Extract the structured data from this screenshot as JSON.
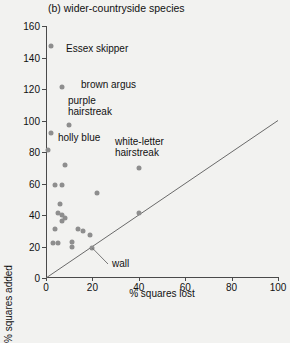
{
  "chart_data": {
    "type": "scatter",
    "title": "(b) wider-countryside species",
    "xlabel": "% squares lost",
    "ylabel": "% squares added",
    "xlim": [
      0,
      100
    ],
    "ylim": [
      0,
      160
    ],
    "xticks": [
      0,
      20,
      40,
      60,
      80,
      100
    ],
    "yticks": [
      0,
      20,
      40,
      60,
      80,
      100,
      120,
      140,
      160
    ],
    "grid": false,
    "legend": "none",
    "reference_line": {
      "name": "one-to-one line",
      "from": [
        0,
        0
      ],
      "to": [
        100,
        100
      ]
    },
    "points": [
      {
        "x": 2,
        "y": 147,
        "label": "Essex skipper"
      },
      {
        "x": 7,
        "y": 121,
        "label": "brown argus"
      },
      {
        "x": 10,
        "y": 97,
        "label": "purple hairstreak"
      },
      {
        "x": 2,
        "y": 92,
        "label": "holly blue"
      },
      {
        "x": 40,
        "y": 70,
        "label": "white-letter hairstreak"
      },
      {
        "x": 20,
        "y": 19,
        "label": "wall"
      },
      {
        "x": 1,
        "y": 81,
        "label": ""
      },
      {
        "x": 8,
        "y": 72,
        "label": ""
      },
      {
        "x": 4,
        "y": 59,
        "label": ""
      },
      {
        "x": 7,
        "y": 59,
        "label": ""
      },
      {
        "x": 22,
        "y": 54,
        "label": ""
      },
      {
        "x": 6,
        "y": 47,
        "label": ""
      },
      {
        "x": 5,
        "y": 41,
        "label": ""
      },
      {
        "x": 7,
        "y": 40,
        "label": ""
      },
      {
        "x": 8,
        "y": 38,
        "label": ""
      },
      {
        "x": 7,
        "y": 36,
        "label": ""
      },
      {
        "x": 40,
        "y": 41,
        "label": ""
      },
      {
        "x": 4,
        "y": 31,
        "label": ""
      },
      {
        "x": 14,
        "y": 31,
        "label": ""
      },
      {
        "x": 16,
        "y": 30,
        "label": ""
      },
      {
        "x": 19,
        "y": 27,
        "label": ""
      },
      {
        "x": 3,
        "y": 22,
        "label": ""
      },
      {
        "x": 5,
        "y": 22,
        "label": ""
      },
      {
        "x": 11,
        "y": 23,
        "label": ""
      },
      {
        "x": 11,
        "y": 20,
        "label": ""
      }
    ],
    "annotations": [
      {
        "name": "essex-skipper",
        "text": "Essex skipper"
      },
      {
        "name": "brown-argus",
        "text": "brown argus"
      },
      {
        "name": "purple-hairstreak",
        "text": "purple\nhairstreak"
      },
      {
        "name": "holly-blue",
        "text": "holly blue"
      },
      {
        "name": "white-letter-hairstreak",
        "text": "white-letter\nhairstreak"
      },
      {
        "name": "wall",
        "text": "wall"
      }
    ]
  },
  "colors": {
    "point": "#8e8e8e",
    "axis": "#4a4a4a",
    "text": "#111111",
    "background": "#f2f2f0"
  }
}
